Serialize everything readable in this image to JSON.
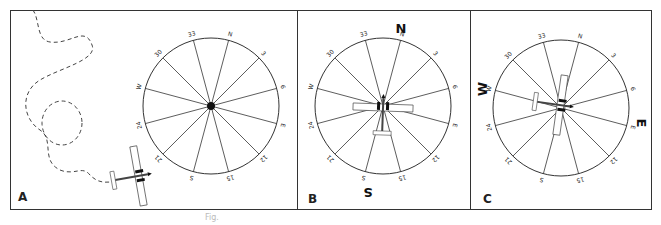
{
  "figure": {
    "caption": "Fig.",
    "panels": [
      {
        "label": "A",
        "description": "Aircraft maneuvering toward compass rose; dashed flight path",
        "compass_labels": [
          "N",
          "3",
          "6",
          "E",
          "12",
          "15",
          "S",
          "21",
          "24",
          "W",
          "30",
          "33"
        ]
      },
      {
        "label": "B",
        "description": "Aircraft on compass rose heading north",
        "cardinal_labels": [
          "N",
          "S"
        ],
        "compass_labels": [
          "N",
          "3",
          "6",
          "E",
          "12",
          "15",
          "S",
          "21",
          "24",
          "W",
          "30",
          "33"
        ]
      },
      {
        "label": "C",
        "description": "Aircraft on compass rose heading east",
        "cardinal_labels": [
          "W",
          "E"
        ],
        "compass_labels": [
          "N",
          "3",
          "6",
          "E",
          "12",
          "15",
          "S",
          "21",
          "24",
          "W",
          "30",
          "33"
        ]
      }
    ]
  }
}
